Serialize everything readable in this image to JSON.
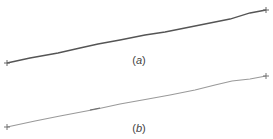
{
  "panels": [
    {
      "id": "a",
      "label_open": "(",
      "label_letter": "a",
      "label_close": ")",
      "line": {
        "x1": 7,
        "y1": 63,
        "x2": 266,
        "y2": 10
      },
      "color": "#555555",
      "stroke_width": 1.3
    },
    {
      "id": "b",
      "label_open": "(",
      "label_letter": "b",
      "label_close": ")",
      "line": {
        "x1": 7,
        "y1": 127,
        "x2": 266,
        "y2": 76
      },
      "color": "#8a8a8a",
      "stroke_width": 1.3
    }
  ]
}
